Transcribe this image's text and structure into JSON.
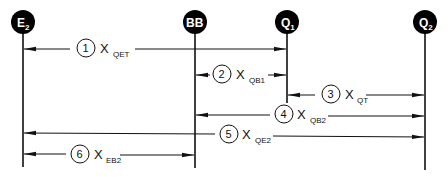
{
  "diagram": {
    "nodes": [
      {
        "id": "E2",
        "label": "E",
        "sub": "2",
        "x": 23
      },
      {
        "id": "BB",
        "label": "BB",
        "sub": "",
        "x": 195
      },
      {
        "id": "Q1",
        "label": "Q",
        "sub": "1",
        "x": 287
      },
      {
        "id": "Q2",
        "label": "Q",
        "sub": "2",
        "x": 425
      }
    ],
    "dimensions": [
      {
        "num": "1",
        "symbol": "X",
        "sub": "QET",
        "from": "E2",
        "to": "Q1"
      },
      {
        "num": "2",
        "symbol": "X",
        "sub": "QB1",
        "from": "BB",
        "to": "Q1"
      },
      {
        "num": "3",
        "symbol": "X",
        "sub": "QT",
        "from": "Q1",
        "to": "Q2"
      },
      {
        "num": "4",
        "symbol": "X",
        "sub": "QB2",
        "from": "BB",
        "to": "Q2"
      },
      {
        "num": "5",
        "symbol": "X",
        "sub": "QE2",
        "from": "E2",
        "to": "Q2"
      },
      {
        "num": "6",
        "symbol": "X",
        "sub": "EB2",
        "from": "E2",
        "to": "BB"
      }
    ],
    "colors": {
      "line": "#111111",
      "node_fill": "#000000",
      "node_text": "#ffffff"
    }
  }
}
